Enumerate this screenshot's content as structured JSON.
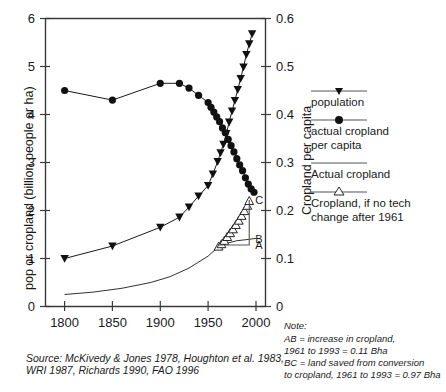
{
  "chart_data": {
    "type": "line",
    "title": "",
    "xlabel": "",
    "ylabel": "pop or cropland (billion people or ha)",
    "y2label": "Cropland per capita",
    "xlim": [
      1780,
      2010
    ],
    "ylim": [
      0,
      6
    ],
    "y2lim": [
      0,
      0.6
    ],
    "grid": false,
    "legend_position": "right",
    "xticks": [
      "1800",
      "1850",
      "1900",
      "1950",
      "2000"
    ],
    "xtick_values": [
      1800,
      1850,
      1900,
      1950,
      2000
    ],
    "yticks": [
      "0",
      "1",
      "2",
      "3",
      "4",
      "5",
      "6"
    ],
    "ytick_values": [
      0,
      1,
      2,
      3,
      4,
      5,
      6
    ],
    "y2ticks": [
      "0",
      "0.1",
      "0.2",
      "0.3",
      "0.4",
      "0.5",
      "0.6"
    ],
    "y2tick_values": [
      0,
      0.1,
      0.2,
      0.3,
      0.4,
      0.5,
      0.6
    ],
    "series": [
      {
        "name": "population",
        "marker": "triangle-down-filled",
        "axis": "left",
        "units": "billion people",
        "points": [
          [
            1800,
            1.0
          ],
          [
            1850,
            1.26
          ],
          [
            1900,
            1.65
          ],
          [
            1920,
            1.86
          ],
          [
            1930,
            2.07
          ],
          [
            1940,
            2.3
          ],
          [
            1950,
            2.52
          ],
          [
            1955,
            2.76
          ],
          [
            1960,
            3.02
          ],
          [
            1963,
            3.2
          ],
          [
            1966,
            3.38
          ],
          [
            1969,
            3.6
          ],
          [
            1972,
            3.84
          ],
          [
            1975,
            4.07
          ],
          [
            1978,
            4.29
          ],
          [
            1981,
            4.52
          ],
          [
            1984,
            4.75
          ],
          [
            1987,
            4.99
          ],
          [
            1990,
            5.25
          ],
          [
            1993,
            5.47
          ],
          [
            1996,
            5.68
          ]
        ]
      },
      {
        "name": "actual cropland per capita",
        "marker": "circle-filled",
        "axis": "right",
        "units": "ha per capita",
        "points": [
          [
            1800,
            0.45
          ],
          [
            1850,
            0.43
          ],
          [
            1900,
            0.465
          ],
          [
            1920,
            0.465
          ],
          [
            1930,
            0.455
          ],
          [
            1940,
            0.44
          ],
          [
            1950,
            0.425
          ],
          [
            1953,
            0.415
          ],
          [
            1956,
            0.405
          ],
          [
            1959,
            0.395
          ],
          [
            1962,
            0.385
          ],
          [
            1965,
            0.372
          ],
          [
            1968,
            0.362
          ],
          [
            1971,
            0.348
          ],
          [
            1974,
            0.335
          ],
          [
            1977,
            0.322
          ],
          [
            1980,
            0.308
          ],
          [
            1983,
            0.295
          ],
          [
            1986,
            0.283
          ],
          [
            1989,
            0.268
          ],
          [
            1992,
            0.255
          ],
          [
            1995,
            0.245
          ],
          [
            1998,
            0.238
          ]
        ]
      },
      {
        "name": "Actual cropland",
        "marker": "none",
        "axis": "left",
        "units": "billion ha",
        "points": [
          [
            1800,
            0.25
          ],
          [
            1830,
            0.3
          ],
          [
            1860,
            0.38
          ],
          [
            1890,
            0.5
          ],
          [
            1910,
            0.62
          ],
          [
            1930,
            0.8
          ],
          [
            1950,
            1.05
          ],
          [
            1961,
            1.25
          ],
          [
            1970,
            1.32
          ],
          [
            1980,
            1.37
          ],
          [
            1993,
            1.4
          ],
          [
            2000,
            1.42
          ]
        ]
      },
      {
        "name": "Cropland, if no tech change after 1961",
        "marker": "triangle-up-open",
        "axis": "left",
        "units": "billion ha",
        "points": [
          [
            1961,
            1.25
          ],
          [
            1964,
            1.3
          ],
          [
            1967,
            1.37
          ],
          [
            1970,
            1.45
          ],
          [
            1973,
            1.53
          ],
          [
            1976,
            1.61
          ],
          [
            1979,
            1.7
          ],
          [
            1982,
            1.79
          ],
          [
            1985,
            1.89
          ],
          [
            1988,
            1.99
          ],
          [
            1991,
            2.1
          ],
          [
            1993,
            2.2
          ]
        ]
      }
    ],
    "annotations": [
      {
        "label": "A",
        "x": 1993,
        "y": 1.28,
        "desc": "baseline-cropland-1961-level"
      },
      {
        "label": "B",
        "x": 1993,
        "y": 1.4,
        "desc": "actual-cropland-1993"
      },
      {
        "label": "C",
        "x": 1993,
        "y": 2.22,
        "desc": "hypothetical-cropland-1993"
      }
    ]
  },
  "axes": {
    "left_title": "pop or cropland (billion people or ha)",
    "right_title": "Cropland per capita"
  },
  "legend": {
    "items": [
      {
        "label": "population",
        "marker": "triangle-down-filled"
      },
      {
        "label": "actual cropland",
        "label2": "per capita",
        "marker": "circle-filled"
      },
      {
        "label": "Actual cropland",
        "marker": "line"
      },
      {
        "label": "Cropland, if no tech",
        "label2": "change after 1961",
        "marker": "triangle-up-open"
      }
    ]
  },
  "source": {
    "line1": "Source: McKivedy & Jones 1978, Houghton et al. 1983,",
    "line2": "WRI 1987, Richards 1990, FAO 1996"
  },
  "note": {
    "heading": "Note:",
    "line1": "AB = increase in cropland,",
    "line2": "1961 to 1993 = 0.11 Bha",
    "line3": "BC = land saved from conversion",
    "line4": "to cropland, 1961 to 1993 = 0.97 Bha"
  },
  "colors": {
    "ink": "#1a1a1a",
    "axis": "#3a3a3a",
    "guide": "#555555",
    "background": "#ffffff"
  }
}
